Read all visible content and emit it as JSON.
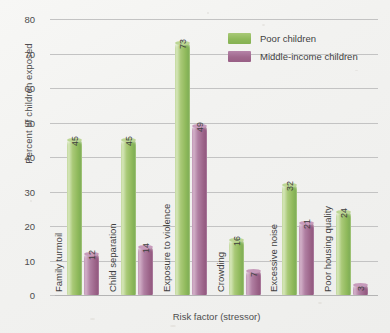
{
  "chart_data": {
    "type": "bar",
    "title": "",
    "xlabel": "Risk factor (stressor)",
    "ylabel": "Percent of children exposed",
    "ylim": [
      0,
      80
    ],
    "yticks": [
      0,
      10,
      20,
      30,
      40,
      50,
      60,
      70,
      80
    ],
    "grid": true,
    "legend_position": "top-right",
    "categories": [
      "Family turmoil",
      "Child separation",
      "Exposure to violence",
      "Crowding",
      "Excessive noise",
      "Poor housing quality"
    ],
    "series": [
      {
        "name": "Poor children",
        "color": "#8fb95b",
        "values": [
          45,
          45,
          73,
          16,
          32,
          24
        ]
      },
      {
        "name": "Middle-income children",
        "color": "#a0688d",
        "values": [
          12,
          14,
          49,
          7,
          21,
          3
        ]
      }
    ]
  },
  "legend": {
    "items": [
      {
        "label": "Poor children"
      },
      {
        "label": "Middle-income children"
      }
    ]
  },
  "axes": {
    "y_title": "Percent of children exposed",
    "x_title": "Risk factor (stressor)"
  }
}
